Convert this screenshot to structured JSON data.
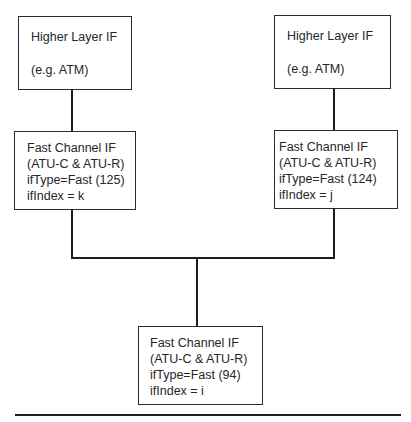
{
  "diagram": {
    "type": "interface-stack",
    "nodes": {
      "higher_left": {
        "title": "Higher Layer IF",
        "subtitle": "(e.g. ATM)"
      },
      "higher_right": {
        "title": "Higher Layer IF",
        "subtitle": "(e.g. ATM)"
      },
      "fast_left": {
        "lines": [
          "Fast Channel IF",
          "(ATU-C & ATU-R)",
          "ifType=Fast (125)",
          "ifIndex = k"
        ]
      },
      "fast_right": {
        "lines": [
          "Fast Channel IF",
          "(ATU-C & ATU-R)",
          "ifType=Fast (124)",
          "ifIndex = j"
        ]
      },
      "fast_bottom": {
        "lines": [
          "Fast Channel IF",
          "(ATU-C & ATU-R)",
          "ifType=Fast (94)",
          "ifIndex = i"
        ]
      }
    },
    "edges": [
      {
        "from": "higher_left",
        "to": "fast_left"
      },
      {
        "from": "higher_right",
        "to": "fast_right"
      },
      {
        "from": "fast_left",
        "to": "fast_bottom"
      },
      {
        "from": "fast_right",
        "to": "fast_bottom"
      }
    ],
    "colors": {
      "stroke": "#1e1e1e",
      "background": "#ffffff"
    }
  }
}
